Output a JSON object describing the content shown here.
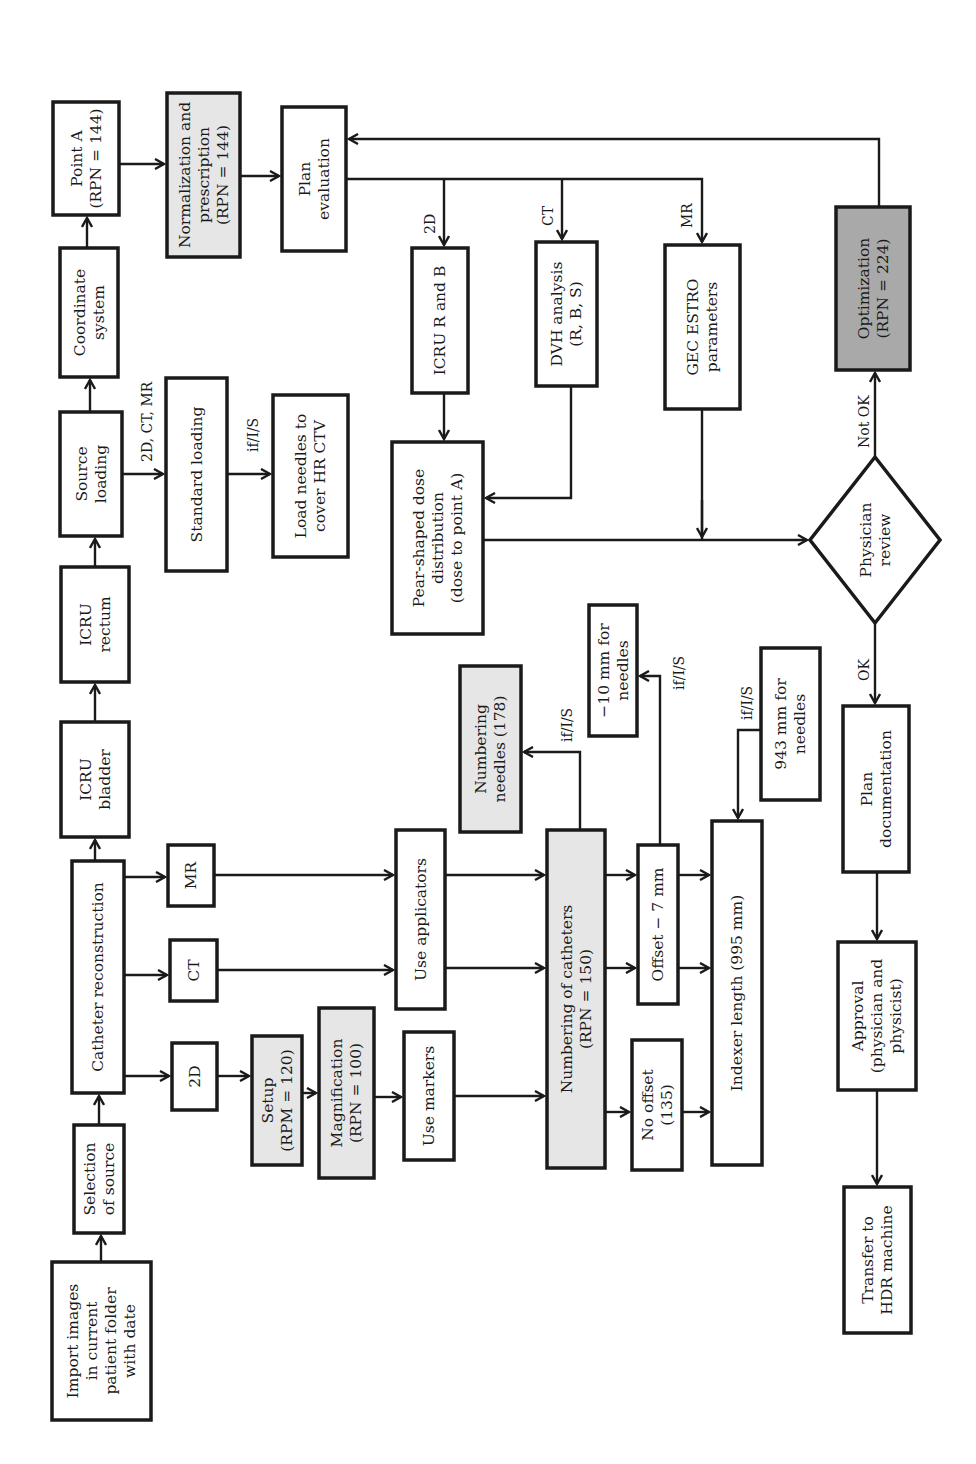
{
  "diagram": {
    "orientation": "rotated -90deg (text reads bottom-to-top)",
    "colors": {
      "stroke": "#1a1a1a",
      "box_fill": "#ffffff",
      "highlight_fill": "#e6e6e6",
      "critical_fill": "#a9a9a9"
    },
    "nodes": {
      "import": {
        "lines": [
          "Import images",
          "in current",
          "patient folder",
          "with date"
        ]
      },
      "selection": {
        "lines": [
          "Selection",
          "of source"
        ]
      },
      "catheter": {
        "lines": [
          "Catheter reconstruction"
        ]
      },
      "bladder": {
        "lines": [
          "ICRU",
          "bladder"
        ]
      },
      "rectum": {
        "lines": [
          "ICRU",
          "rectum"
        ]
      },
      "source": {
        "lines": [
          "Source",
          "loading"
        ]
      },
      "coord": {
        "lines": [
          "Coordinate",
          "system"
        ]
      },
      "pointa": {
        "lines": [
          "Point A",
          "(RPN = 144)"
        ]
      },
      "norm": {
        "lines": [
          "Normalization and",
          "prescription",
          "(RPN = 144)"
        ],
        "highlight": "light"
      },
      "planeval": {
        "lines": [
          "Plan",
          "evaluation"
        ]
      },
      "m2d": {
        "lines": [
          "2D"
        ]
      },
      "mct": {
        "lines": [
          "CT"
        ]
      },
      "mmr": {
        "lines": [
          "MR"
        ]
      },
      "stdload": {
        "lines": [
          "Standard loading"
        ]
      },
      "loadneedles": {
        "lines": [
          "Load needles to",
          "cover HR CTV"
        ]
      },
      "setup": {
        "lines": [
          "Setup",
          "(RPM = 120)"
        ],
        "highlight": "light"
      },
      "magnif": {
        "lines": [
          "Magnification",
          "(RPN = 100)"
        ],
        "highlight": "light"
      },
      "markers": {
        "lines": [
          "Use markers"
        ]
      },
      "applicators": {
        "lines": [
          "Use applicators"
        ]
      },
      "numcath": {
        "lines": [
          "Numbering of catheters",
          "(RPN = 150)"
        ],
        "highlight": "light"
      },
      "numneedles": {
        "lines": [
          "Numbering",
          "needles (178)"
        ],
        "highlight": "light"
      },
      "minus10": {
        "lines": [
          "−10 mm for",
          "needles"
        ]
      },
      "offset7": {
        "lines": [
          "Offset − 7 mm"
        ]
      },
      "nooffset": {
        "lines": [
          "No offset",
          "(135)"
        ]
      },
      "mm943": {
        "lines": [
          "943 mm for",
          "needles"
        ]
      },
      "indexer": {
        "lines": [
          "Indexer length (995 mm)"
        ]
      },
      "pear": {
        "lines": [
          "Pear-shaped dose",
          "distribution",
          "(dose to point A)"
        ]
      },
      "icrurb": {
        "lines": [
          "ICRU R and B"
        ]
      },
      "dvh": {
        "lines": [
          "DVH analysis",
          "(R, B, S)"
        ]
      },
      "gec": {
        "lines": [
          "GEC ESTRO",
          "parameters"
        ]
      },
      "optim": {
        "lines": [
          "Optimization",
          "(RPN = 224)"
        ],
        "highlight": "dark"
      },
      "review": {
        "lines": [
          "Physician",
          "review"
        ],
        "shape": "diamond"
      },
      "plandoc": {
        "lines": [
          "Plan",
          "documentation"
        ]
      },
      "approval": {
        "lines": [
          "Approval",
          "(physician and",
          "physicist)"
        ]
      },
      "transfer": {
        "lines": [
          "Transfer to",
          "HDR machine"
        ]
      }
    },
    "edge_labels": {
      "source_to_std": "2D, CT, MR",
      "std_to_needles": "if/I/S",
      "eval_2d": "2D",
      "eval_ct": "CT",
      "eval_mr": "MR",
      "to_numneedles": "if/I/S",
      "to_minus10": "if/I/S",
      "from_943": "if/I/S",
      "not_ok": "Not OK",
      "ok": "OK"
    }
  }
}
